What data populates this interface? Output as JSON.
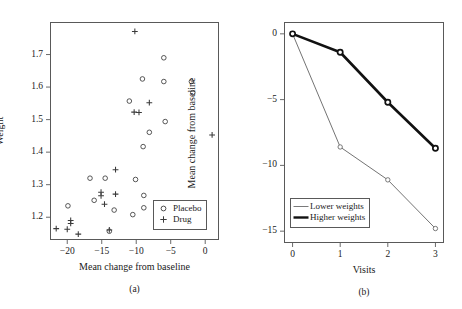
{
  "figure": {
    "title": "",
    "panels": [
      "a",
      "b"
    ]
  },
  "chart_data": [
    {
      "type": "scatter",
      "panel_label": "(a)",
      "title": "",
      "xlabel": "Mean change from baseline",
      "ylabel": "Weight",
      "xlim": [
        -22.5,
        2.0
      ],
      "ylim": [
        1.13,
        1.8
      ],
      "xticks": [
        -20,
        -15,
        -10,
        -5,
        0
      ],
      "xticklabels": [
        "−20",
        "−15",
        "−10",
        "−5",
        "0"
      ],
      "yticks": [
        1.2,
        1.3,
        1.4,
        1.5,
        1.6,
        1.7
      ],
      "yticklabels": [
        "1.2",
        "1.3",
        "1.4",
        "1.5",
        "1.6",
        "1.7"
      ],
      "grid": false,
      "legend_position": "lower right",
      "series": [
        {
          "name": "Placebo",
          "marker": "circle",
          "points": [
            [
              -19.9,
              1.235
            ],
            [
              -16.7,
              1.32
            ],
            [
              -16.1,
              1.252
            ],
            [
              -14.5,
              1.32
            ],
            [
              -13.2,
              1.222
            ],
            [
              -13.9,
              1.157
            ],
            [
              -11.0,
              1.557
            ],
            [
              -10.1,
              1.316
            ],
            [
              -9.1,
              1.625
            ],
            [
              -9.0,
              1.417
            ],
            [
              -8.9,
              1.267
            ],
            [
              -8.9,
              1.229
            ],
            [
              -10.5,
              1.208
            ],
            [
              -8.1,
              1.461
            ],
            [
              -6.0,
              1.69
            ],
            [
              -6.0,
              1.617
            ],
            [
              -5.8,
              1.494
            ],
            [
              -2.0,
              1.617
            ],
            [
              -1.8,
              1.583
            ]
          ]
        },
        {
          "name": "Drug",
          "marker": "plus",
          "points": [
            [
              -21.6,
              1.165
            ],
            [
              -20.0,
              1.163
            ],
            [
              -19.5,
              1.19
            ],
            [
              -19.5,
              1.181
            ],
            [
              -18.4,
              1.148
            ],
            [
              -15.1,
              1.277
            ],
            [
              -15.1,
              1.266
            ],
            [
              -14.6,
              1.24
            ],
            [
              -13.9,
              1.161
            ],
            [
              -13.0,
              1.346
            ],
            [
              -13.0,
              1.271
            ],
            [
              -10.2,
              1.771
            ],
            [
              -10.3,
              1.523
            ],
            [
              -9.6,
              1.522
            ],
            [
              -8.1,
              1.552
            ],
            [
              -6.4,
              1.198
            ],
            [
              1.0,
              1.453
            ]
          ]
        }
      ]
    },
    {
      "type": "line",
      "panel_label": "(b)",
      "title": "",
      "xlabel": "Visits",
      "ylabel": "Mean change from baseline",
      "x": [
        0,
        1,
        2,
        3
      ],
      "xlim": [
        -0.18,
        3.18
      ],
      "ylim": [
        -15.9,
        0.9
      ],
      "xticks": [
        0,
        1,
        2,
        3
      ],
      "xticklabels": [
        "0",
        "1",
        "2",
        "3"
      ],
      "yticks": [
        0,
        -5,
        -10,
        -15
      ],
      "yticklabels": [
        "0",
        "−5",
        "−10",
        "−15"
      ],
      "grid": false,
      "legend_position": "lower left",
      "series": [
        {
          "name": "Lower weights",
          "style": "thin",
          "marker": "circle",
          "values": [
            0.0,
            -8.6,
            -11.1,
            -14.8
          ]
        },
        {
          "name": "Higher weights",
          "style": "thick",
          "marker": "circle",
          "values": [
            0.0,
            -1.4,
            -5.2,
            -8.7
          ]
        }
      ]
    }
  ],
  "colors": {
    "axis": "#595959",
    "marker": "#3a3a3a",
    "line_thin": "#6b6b6b",
    "line_thick": "#111111",
    "text": "#1a1a1a",
    "background": "#ffffff"
  }
}
